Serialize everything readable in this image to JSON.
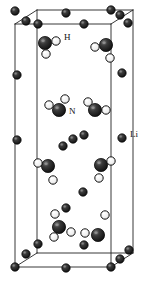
{
  "figure": {
    "name": "crystal-structure-unit-cell",
    "background_color": "#ffffff",
    "width": 148,
    "height": 282
  },
  "cell": {
    "edge_color": "#222222",
    "edge_width": 0.9,
    "front_face": {
      "x": 15,
      "y": 24,
      "w": 96,
      "h": 243
    },
    "depth_dx": 22,
    "depth_dy": -14
  },
  "species": {
    "li": {
      "label": "Li",
      "role": "lithium-atom",
      "color": "#1c1c1c",
      "highlight": "#8a8a8a",
      "outline": "#000000",
      "radius": 4.0
    },
    "n": {
      "label": "N",
      "role": "nitrogen-atom",
      "color": "#1c1c1c",
      "highlight": "#9a9a9a",
      "outline": "#000000",
      "radius": 6.4
    },
    "h": {
      "label": "H",
      "role": "hydrogen-atom",
      "color": "#f2f2f2",
      "highlight": "#ffffff",
      "outline": "#111111",
      "radius": 4.0
    }
  },
  "labels": [
    {
      "text": "H",
      "x": 64,
      "y": 38,
      "target": "hydrogen-atom"
    },
    {
      "text": "N",
      "x": 69,
      "y": 112,
      "target": "nitrogen-atom"
    },
    {
      "text": "Li",
      "x": 130,
      "y": 135,
      "target": "lithium-atom"
    }
  ],
  "atoms": [
    {
      "type": "li",
      "x": 15,
      "y": 11,
      "r": 4.2
    },
    {
      "type": "li",
      "x": 26,
      "y": 21,
      "r": 4.2
    },
    {
      "type": "li",
      "x": 38,
      "y": 24,
      "r": 4.2
    },
    {
      "type": "li",
      "x": 66,
      "y": 13,
      "r": 4.2
    },
    {
      "type": "li",
      "x": 84,
      "y": 24,
      "r": 4.2
    },
    {
      "type": "li",
      "x": 111,
      "y": 10,
      "r": 4.2
    },
    {
      "type": "li",
      "x": 120,
      "y": 15,
      "r": 4.2
    },
    {
      "type": "li",
      "x": 128,
      "y": 23,
      "r": 4.2
    },
    {
      "type": "li",
      "x": 17,
      "y": 75,
      "r": 4.2
    },
    {
      "type": "li",
      "x": 122,
      "y": 73,
      "r": 4.2
    },
    {
      "type": "li",
      "x": 17,
      "y": 140,
      "r": 4.2
    },
    {
      "type": "li",
      "x": 122,
      "y": 138,
      "r": 4.2
    },
    {
      "type": "li",
      "x": 63,
      "y": 146,
      "r": 4.2
    },
    {
      "type": "li",
      "x": 73,
      "y": 139,
      "r": 4.2
    },
    {
      "type": "li",
      "x": 84,
      "y": 135,
      "r": 4.2
    },
    {
      "type": "li",
      "x": 83,
      "y": 192,
      "r": 4.2
    },
    {
      "type": "li",
      "x": 66,
      "y": 208,
      "r": 4.2
    },
    {
      "type": "li",
      "x": 38,
      "y": 244,
      "r": 4.2
    },
    {
      "type": "li",
      "x": 26,
      "y": 254,
      "r": 4.2
    },
    {
      "type": "li",
      "x": 15,
      "y": 267,
      "r": 4.2
    },
    {
      "type": "li",
      "x": 66,
      "y": 268,
      "r": 4.2
    },
    {
      "type": "li",
      "x": 84,
      "y": 245,
      "r": 4.2
    },
    {
      "type": "li",
      "x": 111,
      "y": 267,
      "r": 4.2
    },
    {
      "type": "li",
      "x": 120,
      "y": 259,
      "r": 4.2
    },
    {
      "type": "li",
      "x": 129,
      "y": 250,
      "r": 4.2
    },
    {
      "type": "n",
      "x": 45,
      "y": 43,
      "r": 6.6
    },
    {
      "type": "h",
      "x": 56,
      "y": 41,
      "r": 4.2
    },
    {
      "type": "h",
      "x": 46,
      "y": 54,
      "r": 4.2
    },
    {
      "type": "n",
      "x": 106,
      "y": 45,
      "r": 6.6
    },
    {
      "type": "h",
      "x": 95,
      "y": 47,
      "r": 4.2
    },
    {
      "type": "h",
      "x": 110,
      "y": 58,
      "r": 4.2
    },
    {
      "type": "n",
      "x": 59,
      "y": 110,
      "r": 6.6
    },
    {
      "type": "h",
      "x": 49,
      "y": 105,
      "r": 4.2
    },
    {
      "type": "h",
      "x": 65,
      "y": 99,
      "r": 4.2
    },
    {
      "type": "n",
      "x": 95,
      "y": 110,
      "r": 6.6
    },
    {
      "type": "h",
      "x": 88,
      "y": 102,
      "r": 4.2
    },
    {
      "type": "h",
      "x": 106,
      "y": 110,
      "r": 4.2
    },
    {
      "type": "n",
      "x": 48,
      "y": 166,
      "r": 6.6
    },
    {
      "type": "h",
      "x": 38,
      "y": 163,
      "r": 4.2
    },
    {
      "type": "h",
      "x": 53,
      "y": 180,
      "r": 4.2
    },
    {
      "type": "n",
      "x": 101,
      "y": 165,
      "r": 6.6
    },
    {
      "type": "h",
      "x": 111,
      "y": 161,
      "r": 4.2
    },
    {
      "type": "h",
      "x": 99,
      "y": 178,
      "r": 4.2
    },
    {
      "type": "n",
      "x": 59,
      "y": 227,
      "r": 6.6
    },
    {
      "type": "h",
      "x": 54,
      "y": 237,
      "r": 4.2
    },
    {
      "type": "h",
      "x": 71,
      "y": 232,
      "r": 4.2
    },
    {
      "type": "n",
      "x": 98,
      "y": 235,
      "r": 6.6
    },
    {
      "type": "h",
      "x": 85,
      "y": 233,
      "r": 4.2
    },
    {
      "type": "h",
      "x": 105,
      "y": 215,
      "r": 4.2
    },
    {
      "type": "h",
      "x": 55,
      "y": 214,
      "r": 4.2
    }
  ]
}
